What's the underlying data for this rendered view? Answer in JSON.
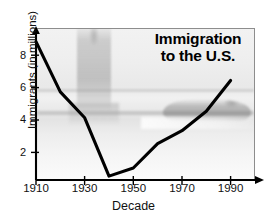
{
  "chart_data": {
    "type": "line",
    "title": "Immigration to the U.S.",
    "title_line1": "Immigration",
    "title_line2": "to the U.S.",
    "xlabel": "Decade",
    "ylabel": "Immigrants (in millions)",
    "x": [
      1910,
      1920,
      1930,
      1940,
      1950,
      1960,
      1970,
      1980,
      1990
    ],
    "values": [
      8.8,
      5.7,
      4.1,
      0.5,
      1.0,
      2.5,
      3.3,
      4.5,
      6.4
    ],
    "series": [
      {
        "name": "Immigrants (in millions)",
        "values": [
          8.8,
          5.7,
          4.1,
          0.5,
          1.0,
          2.5,
          3.3,
          4.5,
          6.4
        ]
      }
    ],
    "xlim": [
      1910,
      2000
    ],
    "ylim": [
      0,
      9.6
    ],
    "xticks": [
      1910,
      1930,
      1950,
      1970,
      1990
    ],
    "xtick_labels": [
      "1910",
      "1930",
      "1950",
      "1970",
      "1990"
    ],
    "yticks": [
      2,
      4,
      6,
      8
    ],
    "ytick_labels": [
      "2",
      "4",
      "6",
      "8"
    ],
    "grid": false,
    "legend": null,
    "line_color": "#000000",
    "background_images": [
      "statue-of-liberty-watermark",
      "ocean-liner-watermark"
    ]
  },
  "axis": {
    "y_arrow": "up-arrow",
    "x_arrow": "right-arrow"
  }
}
